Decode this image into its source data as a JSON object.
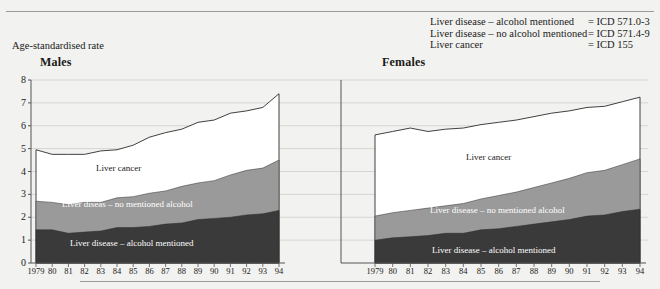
{
  "legend": {
    "rows": [
      {
        "label": "Liver disease – alcohol mentioned",
        "code": "= ICD 571.0-3"
      },
      {
        "label": "Liver disease – no alcohol mentioned",
        "code": "= ICD 571.4-9"
      },
      {
        "label": "Liver cancer",
        "code": "= ICD 155"
      }
    ]
  },
  "axis_caption": "Age-standardised rate",
  "panels": {
    "males": {
      "title": "Males",
      "band_labels": {
        "cancer": "Liver cancer",
        "no_alcohol": "Liver diseas – no mentioned alcohol",
        "alcohol": "Liver disease – alcohol mentioned"
      }
    },
    "females": {
      "title": "Females",
      "band_labels": {
        "cancer": "Liver cancer",
        "no_alcohol": "Liver disease – no mentioned alcohol",
        "alcohol": "Liver disease – alcohol mentioned"
      }
    }
  },
  "colors": {
    "background": "#f2f2f0",
    "alcohol_band": "#3a3a3a",
    "no_alcohol_band": "#9a9a9a",
    "cancer_band": "#ffffff",
    "axis": "#555555",
    "grid": "#c8c8c6"
  },
  "chart_data": {
    "type": "area",
    "title": "Age-standardised rate",
    "xlabel": "",
    "ylabel": "Age-standardised rate",
    "ylim": [
      0,
      8
    ],
    "yticks": [
      0,
      1,
      2,
      3,
      4,
      5,
      6,
      7,
      8
    ],
    "grid": true,
    "legend_position": "top-right",
    "stacked": true,
    "panels": [
      {
        "name": "Males",
        "x": [
          "1979",
          "80",
          "81",
          "82",
          "83",
          "84",
          "85",
          "86",
          "87",
          "88",
          "89",
          "90",
          "91",
          "92",
          "93",
          "94"
        ],
        "series": [
          {
            "name": "Liver disease – alcohol mentioned",
            "values": [
              1.45,
              1.45,
              1.3,
              1.35,
              1.4,
              1.55,
              1.55,
              1.6,
              1.7,
              1.75,
              1.9,
              1.95,
              2.0,
              2.1,
              2.15,
              2.3
            ]
          },
          {
            "name": "Liver diseas – no mentioned alcohol",
            "values": [
              1.25,
              1.2,
              1.25,
              1.3,
              1.25,
              1.3,
              1.35,
              1.45,
              1.45,
              1.6,
              1.6,
              1.65,
              1.85,
              1.95,
              2.0,
              2.2
            ]
          },
          {
            "name": "Liver cancer",
            "values": [
              2.25,
              2.1,
              2.2,
              2.1,
              2.25,
              2.1,
              2.25,
              2.45,
              2.55,
              2.5,
              2.65,
              2.65,
              2.7,
              2.6,
              2.65,
              2.9
            ]
          }
        ],
        "totals": [
          4.95,
          4.75,
          4.75,
          4.75,
          4.9,
          4.95,
          5.15,
          5.5,
          5.7,
          5.85,
          6.15,
          6.25,
          6.55,
          6.65,
          6.8,
          7.4
        ]
      },
      {
        "name": "Females",
        "x": [
          "1979",
          "80",
          "81",
          "82",
          "83",
          "84",
          "85",
          "86",
          "87",
          "88",
          "89",
          "90",
          "91",
          "92",
          "93",
          "94"
        ],
        "series": [
          {
            "name": "Liver disease – alcohol mentioned",
            "values": [
              1.0,
              1.1,
              1.15,
              1.2,
              1.3,
              1.3,
              1.45,
              1.5,
              1.6,
              1.7,
              1.8,
              1.9,
              2.05,
              2.1,
              2.25,
              2.35
            ]
          },
          {
            "name": "Liver disease – no mentioned alcohol",
            "values": [
              1.05,
              1.1,
              1.15,
              1.2,
              1.2,
              1.3,
              1.35,
              1.45,
              1.5,
              1.6,
              1.7,
              1.8,
              1.9,
              1.95,
              2.05,
              2.2
            ]
          },
          {
            "name": "Liver cancer",
            "values": [
              3.55,
              3.55,
              3.6,
              3.35,
              3.35,
              3.3,
              3.25,
              3.2,
              3.15,
              3.1,
              3.05,
              2.95,
              2.85,
              2.8,
              2.75,
              2.7
            ]
          }
        ],
        "totals": [
          5.6,
          5.75,
          5.9,
          5.75,
          5.85,
          5.9,
          6.05,
          6.15,
          6.25,
          6.4,
          6.55,
          6.65,
          6.8,
          6.85,
          7.05,
          7.25
        ]
      }
    ]
  }
}
